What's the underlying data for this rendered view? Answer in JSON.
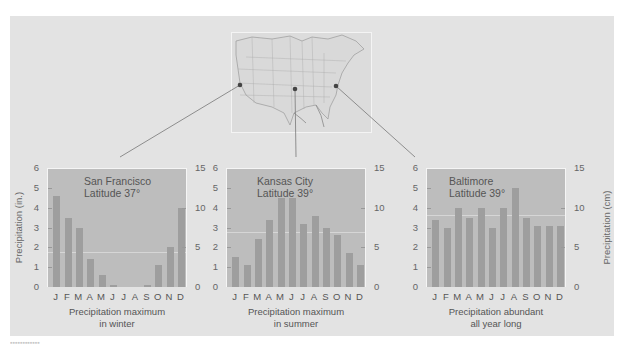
{
  "figure": {
    "left_axis_label": "Precipitation (in.)",
    "right_axis_label": "Precipitation (cm)",
    "left_ticks": [
      "0",
      "1",
      "2",
      "3",
      "4",
      "5",
      "6"
    ],
    "right_ticks": [
      "0",
      "5",
      "10",
      "15"
    ],
    "months": [
      "J",
      "F",
      "M",
      "A",
      "M",
      "J",
      "J",
      "A",
      "S",
      "O",
      "N",
      "D"
    ]
  },
  "map": {
    "markers": [
      "San Francisco",
      "Kansas City",
      "Baltimore"
    ]
  },
  "charts": [
    {
      "city": "San Francisco",
      "latitude": "Latitude 37°",
      "caption_line1": "Precipitation maximum",
      "caption_line2": "in winter"
    },
    {
      "city": "Kansas City",
      "latitude": "Latitude 39°",
      "caption_line1": "Precipitation maximum",
      "caption_line2": "in summer"
    },
    {
      "city": "Baltimore",
      "latitude": "Latitude 39°",
      "caption_line1": "Precipitation abundant",
      "caption_line2": "all year long"
    }
  ],
  "colors": {
    "panel": "#e3e3e3",
    "plot": "#bdbdbd",
    "bar": "#9e9e9e"
  },
  "chart_data": [
    {
      "type": "bar",
      "title": "San Francisco, Latitude 37°",
      "subtitle": "Precipitation maximum in winter",
      "categories": [
        "J",
        "F",
        "M",
        "A",
        "M",
        "J",
        "J",
        "A",
        "S",
        "O",
        "N",
        "D"
      ],
      "values": [
        4.6,
        3.5,
        3.0,
        1.4,
        0.6,
        0.1,
        0.0,
        0.0,
        0.1,
        1.1,
        2.0,
        4.0
      ],
      "xlabel": "",
      "ylabel": "Precipitation (in.)",
      "y2label": "Precipitation (cm)",
      "ylim": [
        0,
        6
      ],
      "y2lim": [
        0,
        15
      ],
      "grid": false
    },
    {
      "type": "bar",
      "title": "Kansas City, Latitude 39°",
      "subtitle": "Precipitation maximum in summer",
      "categories": [
        "J",
        "F",
        "M",
        "A",
        "M",
        "J",
        "J",
        "A",
        "S",
        "O",
        "N",
        "D"
      ],
      "values": [
        1.5,
        1.1,
        2.4,
        3.4,
        4.5,
        4.5,
        3.2,
        3.6,
        3.0,
        2.6,
        1.7,
        1.1
      ],
      "xlabel": "",
      "ylabel": "Precipitation (in.)",
      "y2label": "Precipitation (cm)",
      "ylim": [
        0,
        6
      ],
      "y2lim": [
        0,
        15
      ],
      "grid": false
    },
    {
      "type": "bar",
      "title": "Baltimore, Latitude 39°",
      "subtitle": "Precipitation abundant all year long",
      "categories": [
        "J",
        "F",
        "M",
        "A",
        "M",
        "J",
        "J",
        "A",
        "S",
        "O",
        "N",
        "D"
      ],
      "values": [
        3.4,
        3.0,
        4.0,
        3.5,
        4.0,
        3.0,
        4.0,
        5.0,
        3.5,
        3.1,
        3.1,
        3.1
      ],
      "xlabel": "",
      "ylabel": "Precipitation (in.)",
      "y2label": "Precipitation (cm)",
      "ylim": [
        0,
        6
      ],
      "y2lim": [
        0,
        15
      ],
      "grid": false
    }
  ]
}
